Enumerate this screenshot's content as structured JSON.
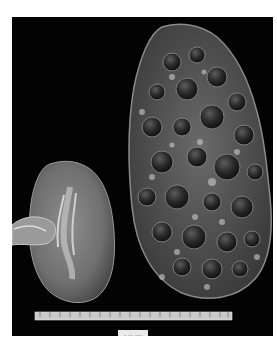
{
  "image": {
    "subject": "Gross specimen photograph comparing a normal kidney and an enlarged polycystic kidney",
    "background_color": "#030303",
    "page_color": "#ffffff",
    "specimens": [
      {
        "name": "normal-kidney",
        "position": "left",
        "appearance": "bisected kidney, tan cortex with central pelvis"
      },
      {
        "name": "polycystic-kidney",
        "position": "right",
        "appearance": "massively enlarged kidney covered with numerous cysts"
      }
    ],
    "scale_ruler": {
      "position": "bottom",
      "units": "cm"
    },
    "specimen_label": "A-99-328"
  }
}
